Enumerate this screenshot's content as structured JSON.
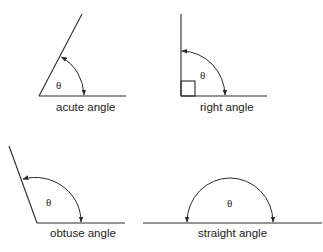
{
  "diagram": {
    "symbol": "θ",
    "panels": [
      {
        "id": "acute",
        "label": "acute angle"
      },
      {
        "id": "right",
        "label": "right angle"
      },
      {
        "id": "obtuse",
        "label": "obtuse angle"
      },
      {
        "id": "straight",
        "label": "straight angle"
      }
    ],
    "colors": {
      "stroke": "#2a2a2a",
      "text": "#222222",
      "background": "#ffffff"
    }
  }
}
